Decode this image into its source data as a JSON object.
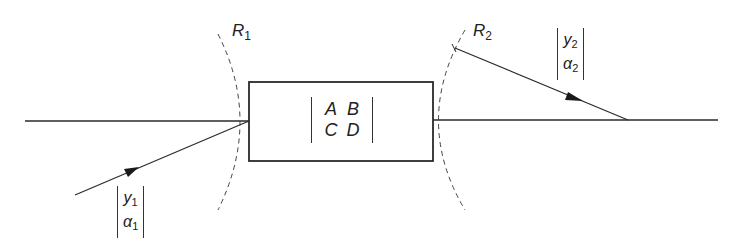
{
  "diagram": {
    "system_matrix": {
      "rows": [
        [
          "A",
          "B"
        ],
        [
          "C",
          "D"
        ]
      ]
    },
    "input_surface": {
      "label": "R",
      "subscript": "1"
    },
    "output_surface": {
      "label": "R",
      "subscript": "2"
    },
    "input_ray": {
      "rows": [
        {
          "sym": "y",
          "sub": "1"
        },
        {
          "sym": "α",
          "sub": "1"
        }
      ]
    },
    "output_ray": {
      "rows": [
        {
          "sym": "y",
          "sub": "2"
        },
        {
          "sym": "α",
          "sub": "2"
        }
      ]
    },
    "colors": {
      "line": "#2a2a2a",
      "background": "#ffffff"
    }
  }
}
